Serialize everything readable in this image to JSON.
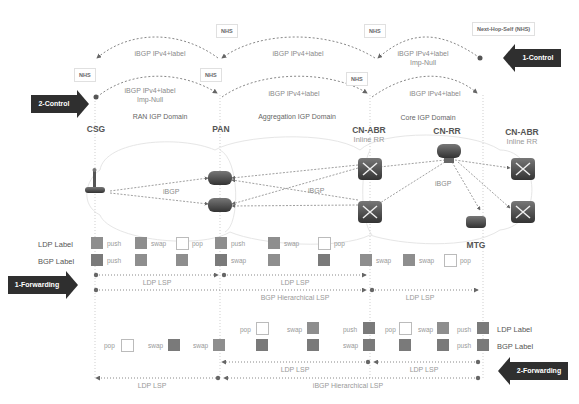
{
  "control": {
    "arrow_1": "1-Control",
    "arrow_2": "2-Control",
    "nhs_tag": "NHS",
    "next_hop_self_tag": "Next-Hop-Self (NHS)",
    "upper_sessions": [
      {
        "text": "iBGP IPv4+label",
        "sub": ""
      },
      {
        "text": "iBGP IPv4+label",
        "sub": ""
      },
      {
        "text": "iBGP IPv4+label",
        "sub": "Imp-Null"
      }
    ],
    "lower_sessions": [
      {
        "text": "iBGP IPv4+label",
        "sub": "Imp-Null"
      },
      {
        "text": "iBGP IPv4+label",
        "sub": ""
      },
      {
        "text": "iBGP IPv4+label",
        "sub": ""
      }
    ]
  },
  "domains": {
    "ran": "RAN IGP Domain",
    "aggregation": "Aggregation IGP Domain",
    "core": "Core IGP Domain"
  },
  "nodes": {
    "csg": "CSG",
    "pan": "PAN",
    "cn_abr_left": {
      "name": "CN-ABR",
      "sub": "Inline RR"
    },
    "cn_rr": "CN-RR",
    "cn_abr_right": {
      "name": "CN-ABR",
      "sub": "Inline RR"
    },
    "mtg": "MTG"
  },
  "ibgp_labels": [
    "iBGP",
    "iBGP",
    "iBGP"
  ],
  "forwarding_1": {
    "arrow": "1-Forwarding",
    "ldp_label": "LDP Label",
    "bgp_label": "BGP Label",
    "ldp_ops": [
      "push",
      "swap",
      "pop",
      "push",
      "swap",
      "pop"
    ],
    "bgp_ops": [
      "push",
      "swap",
      "swap",
      "swap",
      "pop"
    ],
    "lsp": [
      "LDP LSP",
      "LDP LSP",
      "LDP LSP"
    ],
    "hier_lsp": "BGP  Hierarchical LSP"
  },
  "forwarding_2": {
    "arrow": "2-Forwarding",
    "ldp_label": "LDP Label",
    "bgp_label": "BGP Label",
    "ldp_ops": [
      "pop",
      "swap",
      "push",
      "pop",
      "swap",
      "push"
    ],
    "bgp_ops": [
      "pop",
      "swap",
      "swap",
      "swap",
      "push"
    ],
    "lsp": [
      "LDP LSP",
      "LDP LSP",
      "LDP LSP"
    ],
    "hier_lsp": "iBGP  Hierarchical LSP"
  },
  "colors": {
    "arrow_bg": "#2f2f2f",
    "label_fill": "#8e8e8e",
    "line": "#888888"
  }
}
